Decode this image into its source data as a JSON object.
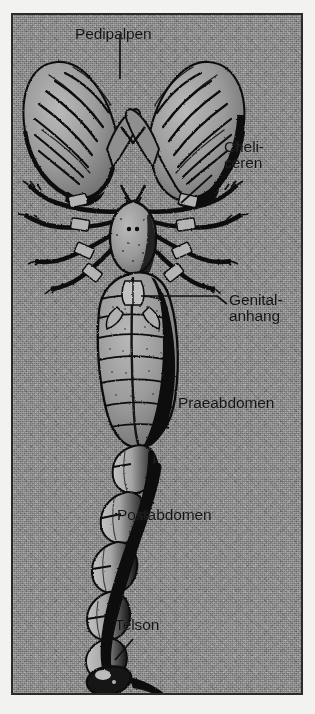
{
  "figure": {
    "kind": "anatomical-illustration",
    "language": "de",
    "background_color": "#8a8a8a",
    "ink_color": "#101010",
    "frame_color": "#2b2b2b"
  },
  "labels": {
    "pedipalpen": {
      "text": "Pedipalpen",
      "lines": [
        "Pedipalpen"
      ]
    },
    "cheliceren": {
      "text": "Cheliceren",
      "lines": [
        "Cheli-",
        "ceren"
      ]
    },
    "genitalanhang": {
      "text": "Genitalanhang",
      "lines": [
        "Genital-",
        "anhang"
      ]
    },
    "praeabdomen": {
      "text": "Praeabdomen",
      "lines": [
        "Praeabdomen"
      ]
    },
    "postabdomen": {
      "text": "Postabdomen",
      "lines": [
        "Postabdomen"
      ]
    },
    "telson": {
      "text": "Telson",
      "lines": [
        "Telson"
      ]
    }
  },
  "leader_lines": [
    {
      "name": "pedipalpen-leader",
      "from": [
        117,
        31
      ],
      "to": [
        117,
        77
      ]
    },
    {
      "name": "cheliceren-leader",
      "from": [
        209,
        168
      ],
      "to": [
        178,
        196
      ]
    },
    {
      "name": "genitalanhang-leader",
      "from": [
        214,
        289
      ],
      "to": [
        136,
        281
      ]
    },
    {
      "name": "telson-leader",
      "from": [
        130,
        634
      ],
      "to": [
        112,
        654
      ]
    }
  ]
}
